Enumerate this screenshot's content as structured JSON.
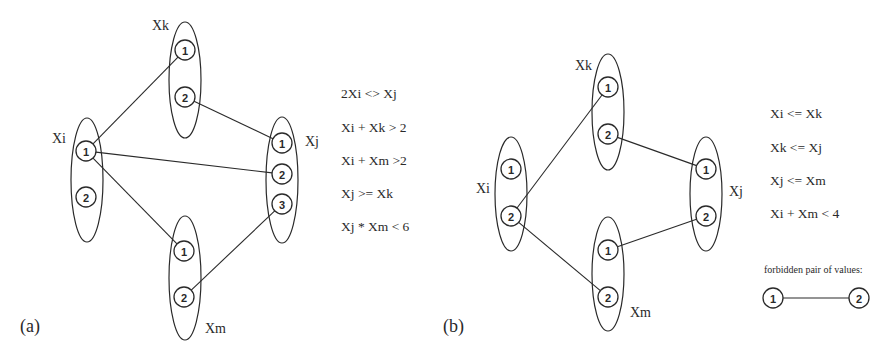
{
  "panels": [
    {
      "id": "a",
      "label": "(a)",
      "label_pos": [
        20,
        332
      ],
      "variables": [
        {
          "name": "Xk",
          "cx": 185,
          "cy": 80,
          "rx": 16,
          "ry": 58,
          "label_pos": [
            152,
            30
          ],
          "values": [
            {
              "v": "1",
              "x": 185,
              "y": 50
            },
            {
              "v": "2",
              "x": 185,
              "y": 97
            }
          ]
        },
        {
          "name": "Xi",
          "cx": 87,
          "cy": 180,
          "rx": 16,
          "ry": 62,
          "label_pos": [
            52,
            143
          ],
          "values": [
            {
              "v": "1",
              "x": 86,
              "y": 151
            },
            {
              "v": "2",
              "x": 86,
              "y": 197
            }
          ]
        },
        {
          "name": "Xj",
          "cx": 282,
          "cy": 180,
          "rx": 16,
          "ry": 63,
          "label_pos": [
            305,
            146
          ],
          "values": [
            {
              "v": "1",
              "x": 282,
              "y": 143
            },
            {
              "v": "2",
              "x": 282,
              "y": 174
            },
            {
              "v": "3",
              "x": 282,
              "y": 204
            }
          ]
        },
        {
          "name": "Xm",
          "cx": 185,
          "cy": 278,
          "rx": 16,
          "ry": 62,
          "label_pos": [
            205,
            333
          ],
          "values": [
            {
              "v": "1",
              "x": 184,
              "y": 251
            },
            {
              "v": "2",
              "x": 184,
              "y": 297
            }
          ]
        }
      ],
      "edges": [
        {
          "from": [
            86,
            151
          ],
          "to": [
            185,
            50
          ]
        },
        {
          "from": [
            185,
            97
          ],
          "to": [
            282,
            143
          ]
        },
        {
          "from": [
            86,
            151
          ],
          "to": [
            282,
            174
          ]
        },
        {
          "from": [
            86,
            151
          ],
          "to": [
            184,
            251
          ]
        },
        {
          "from": [
            184,
            297
          ],
          "to": [
            282,
            204
          ]
        }
      ],
      "constraints": {
        "x": 341,
        "items": [
          {
            "text": "2Xi <> Xj",
            "y": 98
          },
          {
            "text": "Xi + Xk > 2",
            "y": 132
          },
          {
            "text": "Xi + Xm >2",
            "y": 165
          },
          {
            "text": "Xj >= Xk",
            "y": 198
          },
          {
            "text": "Xj * Xm < 6",
            "y": 231
          }
        ]
      }
    },
    {
      "id": "b",
      "label": "(b)",
      "label_pos": [
        443,
        332
      ],
      "variables": [
        {
          "name": "Xk",
          "cx": 608,
          "cy": 112,
          "rx": 16,
          "ry": 58,
          "label_pos": [
            575,
            70
          ],
          "values": [
            {
              "v": "1",
              "x": 608,
              "y": 87
            },
            {
              "v": "2",
              "x": 608,
              "y": 134
            }
          ]
        },
        {
          "name": "Xi",
          "cx": 511,
          "cy": 194,
          "rx": 16,
          "ry": 57,
          "label_pos": [
            476,
            193
          ],
          "values": [
            {
              "v": "1",
              "x": 511,
              "y": 169
            },
            {
              "v": "2",
              "x": 511,
              "y": 216
            }
          ]
        },
        {
          "name": "Xj",
          "cx": 706,
          "cy": 194,
          "rx": 16,
          "ry": 57,
          "label_pos": [
            729,
            196
          ],
          "values": [
            {
              "v": "1",
              "x": 706,
              "y": 169
            },
            {
              "v": "2",
              "x": 706,
              "y": 216
            }
          ]
        },
        {
          "name": "Xm",
          "cx": 608,
          "cy": 274,
          "rx": 16,
          "ry": 57,
          "label_pos": [
            630,
            317
          ],
          "values": [
            {
              "v": "1",
              "x": 608,
              "y": 250
            },
            {
              "v": "2",
              "x": 608,
              "y": 297
            }
          ]
        }
      ],
      "edges": [
        {
          "from": [
            511,
            216
          ],
          "to": [
            608,
            87
          ]
        },
        {
          "from": [
            608,
            134
          ],
          "to": [
            706,
            169
          ]
        },
        {
          "from": [
            511,
            216
          ],
          "to": [
            608,
            297
          ]
        },
        {
          "from": [
            608,
            250
          ],
          "to": [
            706,
            216
          ]
        }
      ],
      "constraints": {
        "x": 770,
        "items": [
          {
            "text": "Xi <= Xk",
            "y": 118
          },
          {
            "text": "Xk <= Xj",
            "y": 152
          },
          {
            "text": "Xj <= Xm",
            "y": 185
          },
          {
            "text": "Xi + Xm < 4",
            "y": 218
          }
        ]
      },
      "legend": {
        "title": "forbidden pair of values:",
        "title_pos": [
          764,
          273
        ],
        "left": {
          "v": "1",
          "x": 773,
          "y": 298
        },
        "right": {
          "v": "2",
          "x": 859,
          "y": 298
        }
      }
    }
  ]
}
